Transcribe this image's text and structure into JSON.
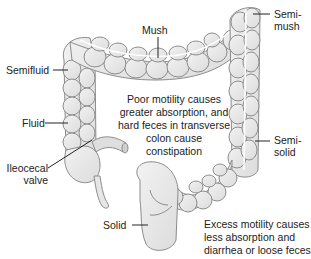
{
  "diagram": {
    "colors": {
      "organ_fill": "#e9e9e9",
      "organ_stroke": "#8c8c8c",
      "leader_line": "#222222",
      "text": "#222222",
      "background": "#ffffff"
    },
    "labels": {
      "mush": "Mush",
      "semi_mush_line1": "Semi-",
      "semi_mush_line2": "mush",
      "semifluid": "Semifluid",
      "fluid": "Fluid",
      "ileocecal_line1": "Ileocecal",
      "ileocecal_line2": "valve",
      "semi_solid_line1": "Semi-",
      "semi_solid_line2": "solid",
      "solid": "Solid"
    },
    "notes": {
      "poor_motility": {
        "line1": "Poor motility causes",
        "line2": "greater absorption, and",
        "line3": "hard feces in transverse",
        "line4": "colon cause",
        "line5": "constipation"
      },
      "excess_motility": {
        "line1": "Excess motility causes",
        "line2": "less absorption and",
        "line3": "diarrhea or loose feces"
      }
    }
  }
}
